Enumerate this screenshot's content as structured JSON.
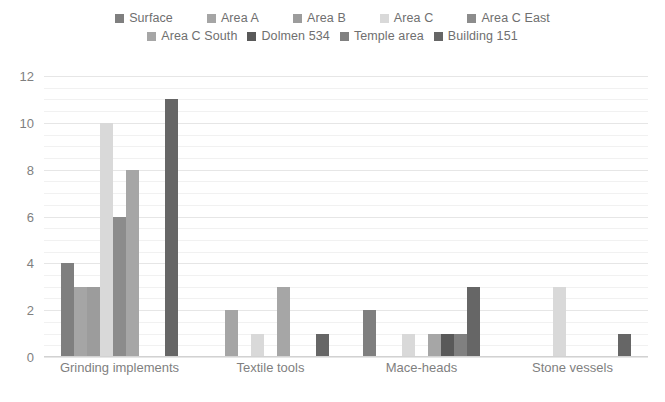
{
  "chart_data": {
    "type": "bar",
    "title": "",
    "xlabel": "",
    "ylabel": "",
    "ylim": [
      0,
      12
    ],
    "yticks": [
      "0",
      "2",
      "4",
      "6",
      "8",
      "10",
      "12"
    ],
    "grid": true,
    "legend_position": "top",
    "categories": [
      "Grinding implements",
      "Textile tools",
      "Mace-heads",
      "Stone vessels"
    ],
    "series": [
      {
        "name": "Surface",
        "color": "#7f7f7f",
        "values": [
          4,
          0,
          2,
          0
        ]
      },
      {
        "name": "Area A",
        "color": "#a5a5a5",
        "values": [
          3,
          2,
          0,
          0
        ]
      },
      {
        "name": "Area B",
        "color": "#9c9c9c",
        "values": [
          3,
          0,
          0,
          0
        ]
      },
      {
        "name": "Area C",
        "color": "#d9d9d9",
        "values": [
          10,
          1,
          1,
          3
        ]
      },
      {
        "name": "Area C East",
        "color": "#8c8c8c",
        "values": [
          6,
          0,
          0,
          0
        ]
      },
      {
        "name": "Area C South",
        "color": "#a6a6a6",
        "values": [
          8,
          3,
          1,
          0
        ]
      },
      {
        "name": "Dolmen 534",
        "color": "#595959",
        "values": [
          0,
          0,
          1,
          0
        ]
      },
      {
        "name": "Temple area",
        "color": "#808080",
        "values": [
          0,
          0,
          1,
          0
        ]
      },
      {
        "name": "Building 151",
        "color": "#666666",
        "values": [
          11,
          1,
          3,
          1
        ]
      }
    ],
    "legend_rows": [
      [
        "Surface",
        "Area A",
        "Area B",
        "Area C",
        "Area C East"
      ],
      [
        "Area C South",
        "Dolmen 534",
        "Temple area",
        "Building 151"
      ]
    ]
  }
}
